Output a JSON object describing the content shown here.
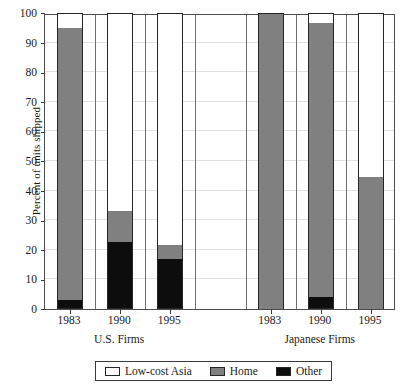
{
  "chart_data": {
    "type": "bar",
    "subtype": "stacked-bar",
    "title": "",
    "xlabel": "",
    "ylabel": "Percent of units shipped",
    "ylim": [
      0,
      100
    ],
    "yticks": [
      0,
      10,
      20,
      30,
      40,
      50,
      60,
      70,
      80,
      90,
      100
    ],
    "ytick_labels": [
      "0",
      "10",
      "20",
      "30",
      "40",
      "50",
      "60",
      "70",
      "80",
      "90",
      "100"
    ],
    "grid": "horizontal-light-vertical-dark",
    "legend_position": "bottom",
    "categories": [
      "1983",
      "1990",
      "1995",
      "1983",
      "1990",
      "1995"
    ],
    "groups": [
      {
        "label": "U.S. Firms",
        "categories": [
          "1983",
          "1990",
          "1995"
        ]
      },
      {
        "label": "Japanese Firms",
        "categories": [
          "1983",
          "1990",
          "1995"
        ]
      }
    ],
    "series": [
      {
        "name": "Other",
        "color": "#0d0d0d",
        "values": [
          3,
          22.5,
          17,
          0,
          4,
          0
        ]
      },
      {
        "name": "Home",
        "color": "#808080",
        "values": [
          92,
          10.5,
          4.5,
          100,
          92.5,
          44.5
        ]
      },
      {
        "name": "Low-cost Asia",
        "color": "#ffffff",
        "values": [
          5,
          67,
          78.5,
          0,
          3.5,
          55.5
        ]
      }
    ],
    "bars": [
      {
        "group": "U.S. Firms",
        "category": "1983",
        "other": 3,
        "home_top": 95,
        "asia_top": 100
      },
      {
        "group": "U.S. Firms",
        "category": "1990",
        "other": 22.5,
        "home_top": 33,
        "asia_top": 100
      },
      {
        "group": "U.S. Firms",
        "category": "1995",
        "other": 17,
        "home_top": 21.5,
        "asia_top": 100
      },
      {
        "group": "Japanese Firms",
        "category": "1983",
        "other": 0,
        "home_top": 100,
        "asia_top": 100
      },
      {
        "group": "Japanese Firms",
        "category": "1990",
        "other": 4,
        "home_top": 96.5,
        "asia_top": 100
      },
      {
        "group": "Japanese Firms",
        "category": "1995",
        "other": 0,
        "home_top": 44.5,
        "asia_top": 100
      }
    ],
    "legend": [
      {
        "label": "Low-cost Asia",
        "color": "#ffffff"
      },
      {
        "label": "Home",
        "color": "#808080"
      },
      {
        "label": "Other",
        "color": "#0d0d0d"
      }
    ]
  },
  "axis": {
    "y_title": "Percent of units shipped",
    "y_labels": [
      "100",
      "90",
      "80",
      "70",
      "60",
      "50",
      "40",
      "30",
      "20",
      "10",
      "0"
    ],
    "x_labels": [
      "1983",
      "1990",
      "1995",
      "1983",
      "1990",
      "1995"
    ],
    "group_labels": [
      "U.S. Firms",
      "Japanese Firms"
    ]
  },
  "legend": {
    "items": [
      {
        "label": "Low-cost Asia",
        "swatch": "white-swatch-icon"
      },
      {
        "label": "Home",
        "swatch": "gray-swatch-icon"
      },
      {
        "label": "Other",
        "swatch": "black-swatch-icon"
      }
    ]
  },
  "colors": {
    "other": "#0d0d0d",
    "home": "#808080",
    "asia": "#ffffff",
    "frame": "#4d4d4d",
    "gridline": "#6e6e6e",
    "hgridline": "#e2e2e2"
  }
}
